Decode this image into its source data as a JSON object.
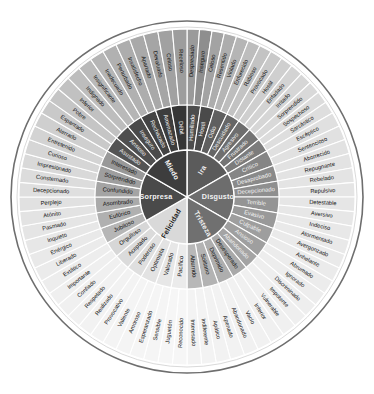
{
  "center": {
    "cx": 187,
    "cy": 197,
    "r_core": 47,
    "r_mid": 92,
    "r_out": 168,
    "rim": 176
  },
  "colors": {
    "ira_core": "#5b5b5b",
    "disgusto_core": "#6d6d6d",
    "tristeza_core": "#707070",
    "felicidad_core": "#d9d9d9",
    "sorpresa_core": "#4a4a4a",
    "miedo_core": "#3d3d3d",
    "rim": "#6e6e6e",
    "background": "#ffffff",
    "label_dark": "#141414",
    "label_light": "#f0f0f0"
  },
  "sectors": [
    {
      "core": "Ira",
      "core_fill": "#5b5b5b",
      "core_text": "light",
      "start_deg": -90,
      "end_deg": -30,
      "branches": [
        {
          "mid": "Humillado",
          "mid_fill": "#4d4d4d",
          "mid_text": "light",
          "outer": [
            {
              "label": "Despreciado",
              "fill": "#9a9a9a",
              "text": "dark"
            },
            {
              "label": "Inseguro",
              "fill": "#8e8e8e",
              "text": "dark"
            }
          ]
        },
        {
          "mid": "Hostil",
          "mid_fill": "#4a4a4a",
          "mid_text": "light",
          "outer": [
            {
              "label": "Celoso",
              "fill": "#a3a3a3",
              "text": "dark"
            },
            {
              "label": "Resentido",
              "fill": "#adadad",
              "text": "dark"
            }
          ]
        },
        {
          "mid": "Odio",
          "mid_fill": "#5f5f5f",
          "mid_text": "light",
          "outer": [
            {
              "label": "Violado",
              "fill": "#b5b5b5",
              "text": "dark"
            },
            {
              "label": "Enfurecido",
              "fill": "#bdbdbd",
              "text": "dark"
            }
          ]
        },
        {
          "mid": "Descuidado",
          "mid_fill": "#666666",
          "mid_text": "light",
          "outer": [
            {
              "label": "Rabioso",
              "fill": "#c3c3c3",
              "text": "dark"
            },
            {
              "label": "Provocado",
              "fill": "#c9c9c9",
              "text": "dark"
            }
          ]
        },
        {
          "mid": "Agresivo",
          "mid_fill": "#6e6e6e",
          "mid_text": "light",
          "outer": [
            {
              "label": "Hostil",
              "fill": "#cfcfcf",
              "text": "dark"
            },
            {
              "label": "Enfadado",
              "fill": "#d3d3d3",
              "text": "dark"
            }
          ]
        },
        {
          "mid": "Frustrado",
          "mid_fill": "#747474",
          "mid_text": "light",
          "outer": [
            {
              "label": "Irritado",
              "fill": "#d6d6d6",
              "text": "dark"
            },
            {
              "label": "Sorprendido",
              "fill": "#d9d9d9",
              "text": "dark"
            }
          ]
        },
        {
          "mid": "Distante",
          "mid_fill": "#7c7c7c",
          "mid_text": "light",
          "outer": [
            {
              "label": "Sospechoso",
              "fill": "#dcdcdc",
              "text": "dark"
            },
            {
              "label": "Sarcástico",
              "fill": "#dedede",
              "text": "dark"
            }
          ]
        }
      ]
    },
    {
      "core": "Disgusto",
      "core_fill": "#6d6d6d",
      "core_text": "light",
      "start_deg": -30,
      "end_deg": 30,
      "branches": [
        {
          "mid": "Crítico",
          "mid_fill": "#858585",
          "mid_text": "light",
          "outer": [
            {
              "label": "Escéptico",
              "fill": "#e0e0e0",
              "text": "dark"
            },
            {
              "label": "Sentencioso",
              "fill": "#e1e1e1",
              "text": "dark"
            }
          ]
        },
        {
          "mid": "Desaprobado",
          "mid_fill": "#8a8a8a",
          "mid_text": "light",
          "outer": [
            {
              "label": "Aborrecido",
              "fill": "#e2e2e2",
              "text": "dark"
            },
            {
              "label": "Repugnante",
              "fill": "#e3e3e3",
              "text": "dark"
            }
          ]
        },
        {
          "mid": "Decepcionado",
          "mid_fill": "#8f8f8f",
          "mid_text": "light",
          "outer": [
            {
              "label": "Rebelado",
              "fill": "#e4e4e4",
              "text": "dark"
            },
            {
              "label": "Repulsivo",
              "fill": "#e5e5e5",
              "text": "dark"
            }
          ]
        },
        {
          "mid": "Terrible",
          "mid_fill": "#949494",
          "mid_text": "light",
          "outer": [
            {
              "label": "Detestable",
              "fill": "#e6e6e6",
              "text": "dark"
            },
            {
              "label": "Aversivo",
              "fill": "#e7e7e7",
              "text": "dark"
            }
          ]
        },
        {
          "mid": "Evasivo",
          "mid_fill": "#999999",
          "mid_text": "light",
          "outer": [
            {
              "label": "Indeciso",
              "fill": "#e8e8e8",
              "text": "dark"
            },
            {
              "label": "Atormentado",
              "fill": "#e9e9e9",
              "text": "dark"
            }
          ]
        },
        {
          "mid": "Culpable",
          "mid_fill": "#9e9e9e",
          "mid_text": "light",
          "outer": [
            {
              "label": "Avergonzado",
              "fill": "#eaeaea",
              "text": "dark"
            },
            {
              "label": "Anhelante",
              "fill": "#ebebeb",
              "text": "dark"
            }
          ]
        }
      ]
    },
    {
      "core": "Tristeza",
      "core_fill": "#707070",
      "core_text": "light",
      "start_deg": 30,
      "end_deg": 90,
      "branches": [
        {
          "mid": "Ansioso",
          "mid_fill": "#9f9f9f",
          "mid_text": "light",
          "outer": [
            {
              "label": "Abrumado",
              "fill": "#ececec",
              "text": "dark"
            },
            {
              "label": "Ignorado",
              "fill": "#ededed",
              "text": "dark"
            }
          ]
        },
        {
          "mid": "Abandonado",
          "mid_fill": "#a4a4a4",
          "mid_text": "light",
          "outer": [
            {
              "label": "Discriminado",
              "fill": "#eeeeee",
              "text": "dark"
            },
            {
              "label": "Impotente",
              "fill": "#efefef",
              "text": "dark"
            }
          ]
        },
        {
          "mid": "Desesperado",
          "mid_fill": "#a9a9a9",
          "mid_text": "dark",
          "outer": [
            {
              "label": "Vulnerable",
              "fill": "#f0f0f0",
              "text": "dark"
            },
            {
              "label": "Inferior",
              "fill": "#f0f0f0",
              "text": "dark"
            }
          ]
        },
        {
          "mid": "Deprimido",
          "mid_fill": "#aeaeae",
          "mid_text": "dark",
          "outer": [
            {
              "label": "Vacío",
              "fill": "#f1f1f1",
              "text": "dark"
            },
            {
              "label": "Abandonado",
              "fill": "#f1f1f1",
              "text": "dark"
            }
          ]
        },
        {
          "mid": "Solitario",
          "mid_fill": "#b3b3b3",
          "mid_text": "dark",
          "outer": [
            {
              "label": "Apenado",
              "fill": "#f2f2f2",
              "text": "dark"
            },
            {
              "label": "Apático",
              "fill": "#f2f2f2",
              "text": "dark"
            }
          ]
        },
        {
          "mid": "Aburrido",
          "mid_fill": "#b8b8b8",
          "mid_text": "dark",
          "outer": [
            {
              "label": "Indiferente",
              "fill": "#f3f3f3",
              "text": "dark"
            },
            {
              "label": "Interesado",
              "fill": "#f3f3f3",
              "text": "dark"
            }
          ]
        }
      ]
    },
    {
      "core": "Felicidad",
      "core_fill": "#d9d9d9",
      "core_text": "dark",
      "start_deg": 90,
      "end_deg": 150,
      "branches": [
        {
          "mid": "Pacífico",
          "mid_fill": "#ebebeb",
          "mid_text": "dark",
          "outer": [
            {
              "label": "Reconocido",
              "fill": "#f6f6f6",
              "text": "dark"
            },
            {
              "label": "Juguetón",
              "fill": "#f6f6f6",
              "text": "dark"
            }
          ]
        },
        {
          "mid": "Valorado",
          "mid_fill": "#e7e7e7",
          "mid_text": "dark",
          "outer": [
            {
              "label": "Sensible",
              "fill": "#f5f5f5",
              "text": "dark"
            },
            {
              "label": "Esperanzado",
              "fill": "#f5f5f5",
              "text": "dark"
            }
          ]
        },
        {
          "mid": "Optimista",
          "mid_fill": "#e3e3e3",
          "mid_text": "dark",
          "outer": [
            {
              "label": "Amoroso",
              "fill": "#f4f4f4",
              "text": "dark"
            },
            {
              "label": "Valiente",
              "fill": "#f4f4f4",
              "text": "dark"
            }
          ]
        },
        {
          "mid": "Poderoso",
          "mid_fill": "#dfdfdf",
          "mid_text": "dark",
          "outer": [
            {
              "label": "Provocativo",
              "fill": "#f3f3f3",
              "text": "dark"
            },
            {
              "label": "Realizado",
              "fill": "#f2f2f2",
              "text": "dark"
            }
          ]
        },
        {
          "mid": "Aceptado",
          "mid_fill": "#dbdbdb",
          "mid_text": "dark",
          "outer": [
            {
              "label": "Respetado",
              "fill": "#f1f1f1",
              "text": "dark"
            },
            {
              "label": "Confiado",
              "fill": "#f0f0f0",
              "text": "dark"
            }
          ]
        },
        {
          "mid": "Orgulloso",
          "mid_fill": "#d7d7d7",
          "mid_text": "dark",
          "outer": [
            {
              "label": "Importante",
              "fill": "#efefef",
              "text": "dark"
            },
            {
              "label": "Extático",
              "fill": "#ededed",
              "text": "dark"
            }
          ]
        }
      ]
    },
    {
      "core": "Sorpresa",
      "core_fill": "#4a4a4a",
      "core_text": "light",
      "start_deg": 150,
      "end_deg": 210,
      "branches": [
        {
          "mid": "Jubiloso",
          "mid_fill": "#b6b6b6",
          "mid_text": "dark",
          "outer": [
            {
              "label": "Liberado",
              "fill": "#ebebeb",
              "text": "dark"
            },
            {
              "label": "Enérgico",
              "fill": "#e9e9e9",
              "text": "dark"
            }
          ]
        },
        {
          "mid": "Eufórico",
          "mid_fill": "#b0b0b0",
          "mid_text": "dark",
          "outer": [
            {
              "label": "Inquieto",
              "fill": "#e7e7e7",
              "text": "dark"
            },
            {
              "label": "Pasmado",
              "fill": "#e5e5e5",
              "text": "dark"
            }
          ]
        },
        {
          "mid": "Asombrado",
          "mid_fill": "#aaaaaa",
          "mid_text": "dark",
          "outer": [
            {
              "label": "Atónito",
              "fill": "#e3e3e3",
              "text": "dark"
            },
            {
              "label": "Perplejo",
              "fill": "#e1e1e1",
              "text": "dark"
            }
          ]
        },
        {
          "mid": "Confundido",
          "mid_fill": "#a4a4a4",
          "mid_text": "dark",
          "outer": [
            {
              "label": "Decepcionado",
              "fill": "#dfdfdf",
              "text": "dark"
            },
            {
              "label": "Consternado",
              "fill": "#dcdcdc",
              "text": "dark"
            }
          ]
        },
        {
          "mid": "Sorprendido",
          "mid_fill": "#9e9e9e",
          "mid_text": "dark",
          "outer": [
            {
              "label": "Impresionado",
              "fill": "#d9d9d9",
              "text": "dark"
            },
            {
              "label": "Curioso",
              "fill": "#d6d6d6",
              "text": "dark"
            }
          ]
        },
        {
          "mid": "Interesado",
          "mid_fill": "#989898",
          "mid_text": "dark",
          "outer": [
            {
              "label": "Entretenido",
              "fill": "#d3d3d3",
              "text": "dark"
            },
            {
              "label": "Aterrado",
              "fill": "#cfcfcf",
              "text": "dark"
            }
          ]
        }
      ]
    },
    {
      "core": "Miedo",
      "core_fill": "#3d3d3d",
      "core_text": "light",
      "start_deg": 210,
      "end_deg": 270,
      "branches": [
        {
          "mid": "Asustado",
          "mid_fill": "#545454",
          "mid_text": "light",
          "outer": [
            {
              "label": "Espantado",
              "fill": "#c9c9c9",
              "text": "dark"
            },
            {
              "label": "Pobre",
              "fill": "#c5c5c5",
              "text": "dark"
            }
          ]
        },
        {
          "mid": "Ansioso",
          "mid_fill": "#4f4f4f",
          "mid_text": "light",
          "outer": [
            {
              "label": "Inferior",
              "fill": "#c1c1c1",
              "text": "dark"
            },
            {
              "label": "Indignado",
              "fill": "#bdbdbd",
              "text": "dark"
            }
          ]
        },
        {
          "mid": "Inseguro",
          "mid_fill": "#4a4a4a",
          "mid_text": "light",
          "outer": [
            {
              "label": "Insignificante",
              "fill": "#b9b9b9",
              "text": "dark"
            },
            {
              "label": "Inadecuado",
              "fill": "#b5b5b5",
              "text": "dark"
            }
          ]
        },
        {
          "mid": "Rechazado",
          "mid_fill": "#434343",
          "mid_text": "light",
          "outer": [
            {
              "label": "Perturbado",
              "fill": "#b1b1b1",
              "text": "dark"
            },
            {
              "label": "Insatisfecho",
              "fill": "#adadad",
              "text": "dark"
            }
          ]
        },
        {
          "mid": "Amenazado",
          "mid_fill": "#3d3d3d",
          "mid_text": "light",
          "outer": [
            {
              "label": "Apartado",
              "fill": "#a9a9a9",
              "text": "dark"
            },
            {
              "label": "Devaluado",
              "fill": "#a5a5a5",
              "text": "dark"
            }
          ]
        },
        {
          "mid": "Débil",
          "mid_fill": "#363636",
          "mid_text": "light",
          "outer": [
            {
              "label": "Celoso",
              "fill": "#a1a1a1",
              "text": "dark"
            },
            {
              "label": "Receloso",
              "fill": "#9d9d9d",
              "text": "dark"
            }
          ]
        }
      ]
    }
  ]
}
